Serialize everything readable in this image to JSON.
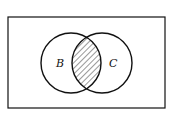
{
  "diagram": {
    "type": "venn",
    "universe": {
      "x": 8,
      "y": 17,
      "width": 157,
      "height": 91
    },
    "sets": [
      {
        "label": "B",
        "cx": 71,
        "cy": 63,
        "r": 30
      },
      {
        "label": "C",
        "cx": 102,
        "cy": 63,
        "r": 30
      }
    ],
    "shaded_region": "B ∩ C",
    "colors": {
      "stroke": "#111111",
      "background": "#ffffff",
      "hatch": "#333333"
    }
  }
}
